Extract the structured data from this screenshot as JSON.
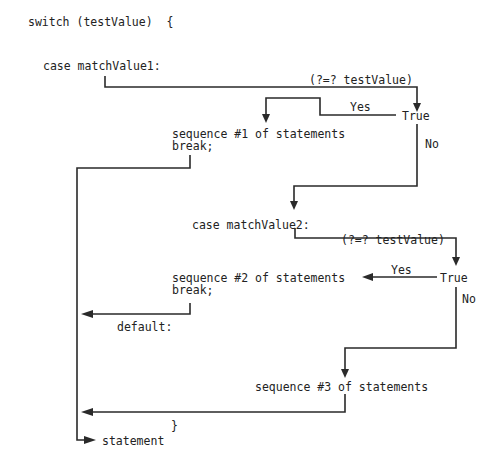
{
  "diagram": {
    "header": "switch (testValue)  {",
    "case1": {
      "label": "case matchValue1:",
      "condition": "(?=? testValue)",
      "true_label": "True",
      "yes_label": "Yes",
      "no_label": "No",
      "body": "sequence #1 of statements",
      "break": "break;"
    },
    "case2": {
      "label": "case matchValue2:",
      "condition": "(?=? testValue)",
      "true_label": "True",
      "yes_label": "Yes",
      "no_label": "No",
      "body": "sequence #2 of statements",
      "break": "break;"
    },
    "default": {
      "label": "default:",
      "body": "sequence #3 of statements"
    },
    "closing_brace": "}",
    "after": "statement",
    "line_color": "#2a2a2a",
    "text_color": "#222222"
  }
}
